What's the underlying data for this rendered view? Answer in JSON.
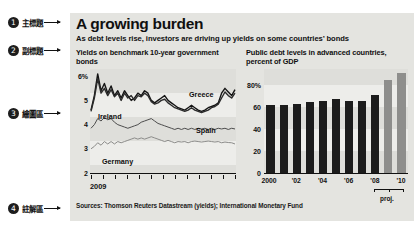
{
  "annotations": [
    {
      "num": "1",
      "label": "主標題",
      "icon": "arrow-right-icon"
    },
    {
      "num": "2",
      "label": "副標題",
      "icon": "arrow-right-icon"
    },
    {
      "num": "3",
      "label": "繪圖區",
      "icon": "arrow-right-icon"
    },
    {
      "num": "4",
      "label": "註解區",
      "icon": "arrow-right-icon"
    }
  ],
  "graphic": {
    "title": "A growing burden",
    "subtitle": "As debt levels rise, investors are driving up yields on some countries’ bonds",
    "source": "Sources: Thomson Reuters Datastream (yields); International Monetary Fund"
  },
  "chart_data": [
    {
      "type": "line",
      "title": "Yields on benchmark 10-year government bonds",
      "xlabel": "2009",
      "ylabel": "",
      "ylim": [
        2,
        6.3
      ],
      "yticks": [
        "6%",
        "5",
        "4",
        "3",
        "2"
      ],
      "ytick_values": [
        6,
        5,
        4,
        3,
        2
      ],
      "xticks": [
        "2009"
      ],
      "xtick_count": 13,
      "grid": "horizontal-bands",
      "legend": "inline-labels",
      "series": [
        {
          "name": "Greece",
          "color": "#141414",
          "label_position": "top-right",
          "values": [
            4.6,
            5.2,
            6.1,
            5.4,
            5.7,
            5.3,
            5.6,
            5.2,
            5.4,
            5.1,
            5.4,
            5.2,
            5.0,
            5.1,
            5.3,
            5.2,
            5.4,
            5.3,
            5.0,
            4.9,
            5.0,
            5.1,
            5.2,
            5.0,
            4.9,
            4.8,
            4.7,
            4.65,
            4.6,
            4.7,
            4.8,
            4.7,
            4.6,
            4.55,
            4.6,
            4.7,
            4.75,
            4.8,
            4.9,
            5.3,
            5.5,
            5.35,
            5.2,
            5.45
          ]
        },
        {
          "name": "Ireland",
          "color": "#2b2b2b",
          "label_position": "left-mid",
          "values": [
            4.55,
            5.1,
            5.9,
            5.3,
            5.5,
            5.2,
            5.45,
            5.15,
            5.3,
            5.0,
            5.3,
            5.1,
            5.2,
            5.0,
            5.2,
            5.15,
            5.3,
            5.2,
            4.95,
            4.85,
            4.9,
            5.0,
            5.05,
            4.9,
            4.8,
            4.7,
            4.65,
            4.6,
            4.55,
            4.6,
            4.7,
            4.6,
            4.55,
            4.5,
            4.55,
            4.6,
            4.7,
            4.75,
            4.85,
            5.1,
            5.35,
            5.2,
            5.1,
            5.3
          ]
        },
        {
          "name": "Spain",
          "color": "#4d4d4d",
          "label_position": "right-mid",
          "values": [
            3.85,
            4.0,
            4.25,
            4.15,
            4.3,
            4.2,
            4.25,
            4.1,
            4.0,
            3.95,
            3.9,
            3.85,
            3.9,
            3.95,
            4.0,
            4.1,
            4.15,
            4.2,
            4.25,
            4.15,
            4.05,
            4.0,
            3.95,
            3.9,
            3.85,
            3.8,
            3.85,
            3.8,
            3.85,
            3.8,
            3.85,
            3.8,
            3.85,
            3.82,
            3.85,
            3.8,
            3.85,
            3.8,
            3.85,
            3.82,
            3.85,
            3.8,
            3.85,
            3.82
          ]
        },
        {
          "name": "Germany",
          "color": "#8c8c8a",
          "label_position": "bottom-left",
          "values": [
            3.0,
            3.1,
            3.25,
            3.15,
            3.3,
            3.2,
            3.3,
            3.2,
            3.3,
            3.25,
            3.3,
            3.35,
            3.4,
            3.45,
            3.4,
            3.45,
            3.4,
            3.45,
            3.5,
            3.45,
            3.4,
            3.35,
            3.3,
            3.35,
            3.3,
            3.25,
            3.3,
            3.28,
            3.3,
            3.25,
            3.3,
            3.32,
            3.3,
            3.28,
            3.3,
            3.32,
            3.3,
            3.28,
            3.3,
            3.25,
            3.28,
            3.26,
            3.25,
            3.2
          ]
        }
      ]
    },
    {
      "type": "bar",
      "title": "Public debt levels in advanced countries, percent of GDP",
      "xlabel": "",
      "ylabel": "",
      "ylim": [
        0,
        95
      ],
      "yticks": [
        "80%",
        "60",
        "40",
        "20",
        "0"
      ],
      "ytick_values": [
        80,
        60,
        40,
        20,
        0
      ],
      "categories": [
        "2000",
        "'01",
        "'02",
        "'03",
        "'04",
        "'05",
        "'06",
        "'07",
        "'08",
        "'09",
        "'10"
      ],
      "xtick_labels": [
        "2000",
        "'02",
        "'04",
        "'06",
        "'08",
        "'10"
      ],
      "values": [
        62,
        62,
        63,
        65,
        66,
        68,
        66,
        66,
        71,
        85,
        91
      ],
      "bar_kinds": [
        "hist",
        "hist",
        "hist",
        "hist",
        "hist",
        "hist",
        "hist",
        "hist",
        "hist",
        "proj",
        "proj"
      ],
      "colors": {
        "historical": "#1c1c1c",
        "projected": "#8e8e8c"
      },
      "annotation": "proj.",
      "annotation_span": [
        "'09",
        "'10"
      ],
      "grid": "horizontal-bands"
    }
  ]
}
